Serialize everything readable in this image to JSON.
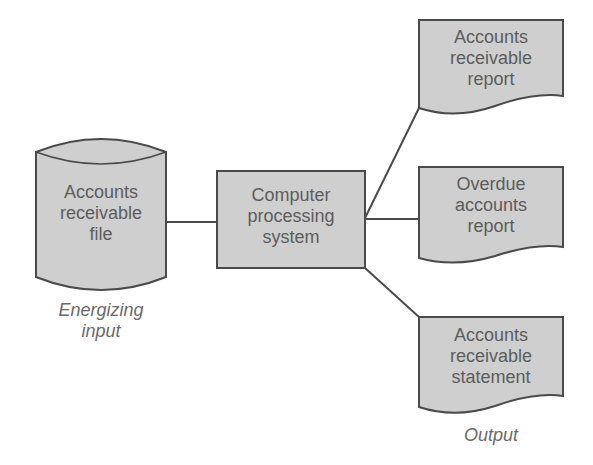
{
  "diagram": {
    "type": "system-flowchart",
    "colors": {
      "fill": "#cfcfcf",
      "stroke": "#4a4a4a",
      "text": "#5c5c5c",
      "background": "#ffffff"
    },
    "nodes": [
      {
        "id": "input_file",
        "shape": "cylinder",
        "lines": [
          "Accounts",
          "receivable",
          "file"
        ]
      },
      {
        "id": "processor",
        "shape": "rectangle",
        "lines": [
          "Computer",
          "processing",
          "system"
        ]
      },
      {
        "id": "report1",
        "shape": "document",
        "lines": [
          "Accounts",
          "receivable",
          "report"
        ]
      },
      {
        "id": "report2",
        "shape": "document",
        "lines": [
          "Overdue",
          "accounts",
          "report"
        ]
      },
      {
        "id": "statement",
        "shape": "document",
        "lines": [
          "Accounts",
          "receivable",
          "statement"
        ]
      }
    ],
    "edges": [
      {
        "from": "input_file",
        "to": "processor"
      },
      {
        "from": "processor",
        "to": "report1"
      },
      {
        "from": "processor",
        "to": "report2"
      },
      {
        "from": "processor",
        "to": "statement"
      }
    ],
    "captions": {
      "input": [
        "Energizing",
        "input"
      ],
      "output": [
        "Output"
      ]
    }
  }
}
